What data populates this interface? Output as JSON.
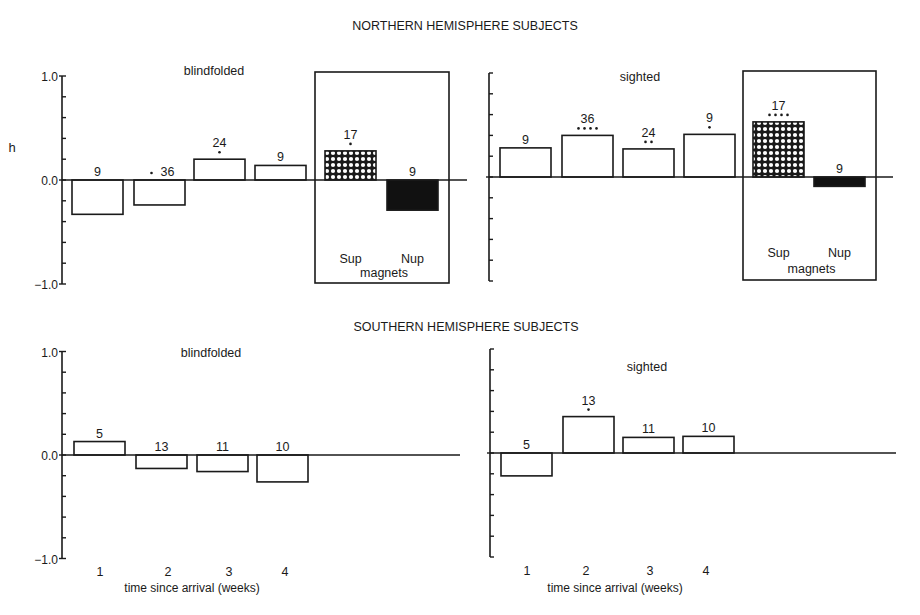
{
  "figure": {
    "north_title": "NORTHERN HEMISPHERE SUBJECTS",
    "south_title": "SOUTHERN HEMISPHERE SUBJECTS",
    "ylabel": "h",
    "xlabel": "time since arrival (weeks)",
    "magnets_label": "magnets",
    "colors": {
      "ink": "#1a1a1a",
      "bar_fill": "#ffffff",
      "nup_fill": "#111111",
      "background": "#ffffff"
    }
  },
  "chart_data": [
    {
      "type": "bar",
      "title": "NORTHERN HEMISPHERE SUBJECTS — blindfolded",
      "panel_label": "blindfolded",
      "ylabel": "h",
      "ylim": [
        -1.0,
        1.0
      ],
      "yticks": [
        "1.0",
        "0.0",
        "-1.0"
      ],
      "grid": false,
      "categories": [
        "1",
        "2",
        "3",
        "4"
      ],
      "values": [
        -0.33,
        -0.24,
        0.2,
        0.14
      ],
      "n_labels": [
        "9",
        "36",
        "24",
        "9"
      ],
      "significance_dots": [
        0,
        1,
        1,
        0
      ],
      "magnets": {
        "label": "magnets",
        "categories": [
          "Sup",
          "Nup"
        ],
        "values": [
          0.28,
          -0.29
        ],
        "n_labels": [
          "17",
          "9"
        ],
        "significance_dots": [
          1,
          0
        ],
        "fills": [
          "crosshatch",
          "solid-black"
        ]
      }
    },
    {
      "type": "bar",
      "title": "NORTHERN HEMISPHERE SUBJECTS — sighted",
      "panel_label": "sighted",
      "ylabel": "h",
      "ylim": [
        -1.0,
        1.0
      ],
      "grid": false,
      "categories": [
        "1",
        "2",
        "3",
        "4"
      ],
      "values": [
        0.28,
        0.4,
        0.27,
        0.41
      ],
      "n_labels": [
        "9",
        "36",
        "24",
        "9"
      ],
      "significance_dots": [
        0,
        4,
        2,
        1
      ],
      "magnets": {
        "label": "magnets",
        "categories": [
          "Sup",
          "Nup"
        ],
        "values": [
          0.53,
          -0.09
        ],
        "n_labels": [
          "17",
          "9"
        ],
        "significance_dots": [
          4,
          0
        ],
        "fills": [
          "crosshatch",
          "solid-black"
        ]
      }
    },
    {
      "type": "bar",
      "title": "SOUTHERN HEMISPHERE SUBJECTS — blindfolded",
      "panel_label": "blindfolded",
      "xlabel": "time since arrival (weeks)",
      "ylim": [
        -1.0,
        1.0
      ],
      "yticks": [
        "1.0",
        "0.0",
        "-1.0"
      ],
      "grid": false,
      "categories": [
        "1",
        "2",
        "3",
        "4"
      ],
      "values": [
        0.13,
        -0.13,
        -0.16,
        -0.26
      ],
      "n_labels": [
        "5",
        "13",
        "11",
        "10"
      ],
      "significance_dots": [
        0,
        0,
        0,
        0
      ]
    },
    {
      "type": "bar",
      "title": "SOUTHERN HEMISPHERE SUBJECTS — sighted",
      "panel_label": "sighted",
      "xlabel": "time since arrival (weeks)",
      "ylim": [
        -1.0,
        1.0
      ],
      "grid": false,
      "categories": [
        "1",
        "2",
        "3",
        "4"
      ],
      "values": [
        -0.22,
        0.35,
        0.15,
        0.16
      ],
      "n_labels": [
        "5",
        "13",
        "11",
        "10"
      ],
      "significance_dots": [
        0,
        1,
        0,
        0
      ]
    }
  ]
}
